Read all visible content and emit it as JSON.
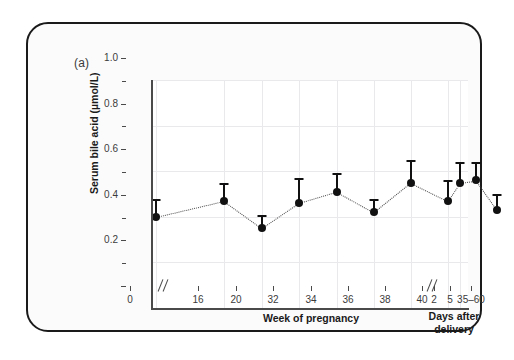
{
  "figure": {
    "panel_label": "(a)"
  },
  "chart_data": {
    "type": "scatter",
    "title": "",
    "ylabel": "Serum bile acid (µmol/L)",
    "xlabel": "Week of pregnancy",
    "xlabel_secondary": "Days after delivery",
    "ylim": [
      0,
      1.0
    ],
    "y_ticks": [
      0,
      0.2,
      0.4,
      0.6,
      0.8,
      1.0
    ],
    "y_tick_labels": [
      "",
      "0.2",
      "0.4",
      "0.6",
      "0.8",
      "1.0"
    ],
    "y_minor_ticks": [
      0.1,
      0.3,
      0.5,
      0.7,
      0.9
    ],
    "grid": true,
    "legend": "none",
    "axis_breaks": [
      {
        "after_category": "0",
        "symbol": "//"
      },
      {
        "after_category": "40",
        "symbol": "//"
      }
    ],
    "categories": [
      "0",
      "16",
      "20",
      "32",
      "34",
      "36",
      "38",
      "40",
      "2",
      "5",
      "35–60"
    ],
    "x_tick_labels": [
      "0",
      "16",
      "20",
      "32",
      "34",
      "36",
      "38",
      "40",
      "2",
      "5",
      "35–60"
    ],
    "values": [
      0.4,
      0.47,
      0.35,
      0.46,
      0.51,
      0.42,
      0.55,
      0.47,
      0.55,
      0.56,
      0.43
    ],
    "error_upper": [
      0.48,
      0.55,
      0.41,
      0.57,
      0.59,
      0.48,
      0.65,
      0.56,
      0.64,
      0.64,
      0.5
    ],
    "error_type": "upper-only",
    "connector_style": "dotted",
    "marker": "filled-circle",
    "marker_color": "#111111",
    "grid_color": "#e9e9ec",
    "axis_color": "#4a4a4a"
  }
}
